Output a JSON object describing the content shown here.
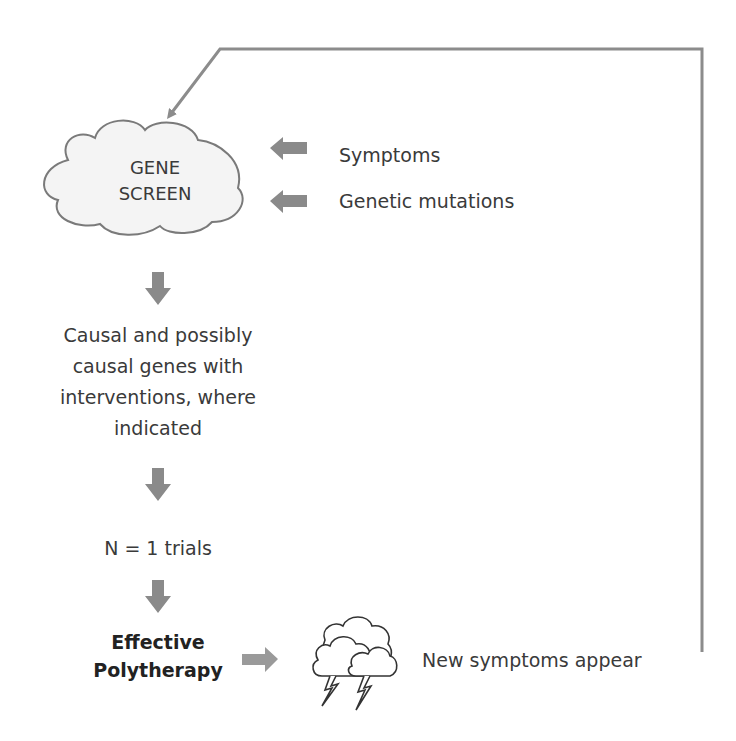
{
  "diagram": {
    "type": "flowchart",
    "colors": {
      "arrow_fill": "#8a8a8a",
      "feedback_line": "#8c8c8c",
      "cloud_fill": "#f4f4f4",
      "cloud_stroke": "#7a7a7a",
      "text": "#3a3a3a"
    },
    "nodes": {
      "gene_screen": {
        "line1": "GENE",
        "line2": "SCREEN"
      },
      "inputs": [
        {
          "label": "Symptoms"
        },
        {
          "label": "Genetic mutations"
        }
      ],
      "causal_genes": {
        "line1": "Causal and possibly",
        "line2": "causal genes with",
        "line3": "interventions, where",
        "line4": "indicated"
      },
      "trials": {
        "label": "N = 1 trials"
      },
      "polytherapy": {
        "line1": "Effective",
        "line2": "Polytherapy"
      },
      "new_symptoms": {
        "label": "New symptoms appear",
        "icon": "storm-clouds-icon"
      }
    },
    "edges": [
      {
        "from": "Symptoms",
        "to": "GENE SCREEN"
      },
      {
        "from": "Genetic mutations",
        "to": "GENE SCREEN"
      },
      {
        "from": "GENE SCREEN",
        "to": "Causal and possibly causal genes"
      },
      {
        "from": "Causal and possibly causal genes",
        "to": "N = 1 trials"
      },
      {
        "from": "N = 1 trials",
        "to": "Effective Polytherapy"
      },
      {
        "from": "Effective Polytherapy",
        "to": "New symptoms appear"
      },
      {
        "from": "New symptoms appear",
        "to": "GENE SCREEN",
        "style": "feedback-line"
      }
    ]
  }
}
